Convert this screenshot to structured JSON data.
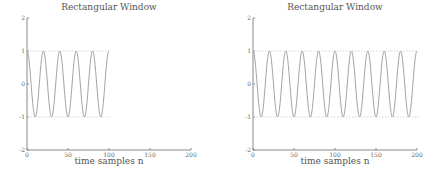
{
  "chart_data": [
    {
      "type": "line",
      "title": "Rectangular Window",
      "xlabel": "time samples n",
      "ylabel": "",
      "xlim": [
        0,
        200
      ],
      "ylim": [
        -2,
        2
      ],
      "xticks": [
        0,
        50,
        100,
        150,
        200
      ],
      "xtick_labels": [
        "0",
        "50",
        "100",
        "150",
        "200"
      ],
      "yticks": [
        -2,
        -1,
        0,
        1,
        2
      ],
      "ytick_labels": [
        "-2",
        "-1",
        "0",
        "1",
        "2"
      ],
      "grid": false,
      "reference_lines_y": [
        1,
        -1
      ],
      "series": [
        {
          "name": "windowed cosine",
          "function": "cos(2*pi*n/20)",
          "n_range": [
            0,
            100
          ],
          "period": 20
        }
      ]
    },
    {
      "type": "line",
      "title": "Rectangular Window",
      "xlabel": "time samples n",
      "ylabel": "",
      "xlim": [
        0,
        200
      ],
      "ylim": [
        -2,
        2
      ],
      "xticks": [
        0,
        50,
        100,
        150,
        200
      ],
      "xtick_labels": [
        "0",
        "50",
        "100",
        "150",
        "200"
      ],
      "yticks": [
        -2,
        -1,
        0,
        1,
        2
      ],
      "ytick_labels": [
        "-2",
        "-1",
        "0",
        "1",
        "2"
      ],
      "grid": false,
      "reference_lines_y": [
        1,
        -1
      ],
      "series": [
        {
          "name": "windowed cosine",
          "function": "cos(2*pi*n/20)",
          "n_range": [
            0,
            200
          ],
          "period": 20
        }
      ]
    }
  ]
}
